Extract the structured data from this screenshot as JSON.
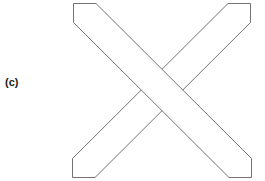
{
  "figure": {
    "label": "(c)",
    "caption_position": "left-middle",
    "background_color": "#ffffff",
    "line_color": "#5a5a5a",
    "fill_color": "#ffffff",
    "line_width_px": 0.85,
    "width_px": 265,
    "height_px": 181,
    "shapes": [
      {
        "name": "descending-bar",
        "orientation": "top-left to bottom-right",
        "depth": "front",
        "corners": "74,3 95,3 250,160 250,178 228,178 74,22"
      },
      {
        "name": "ascending-bar",
        "orientation": "bottom-left to top-right",
        "depth": "back",
        "corners": "72,160 72,178 94,178 249,21 249,3 227,3"
      }
    ]
  }
}
